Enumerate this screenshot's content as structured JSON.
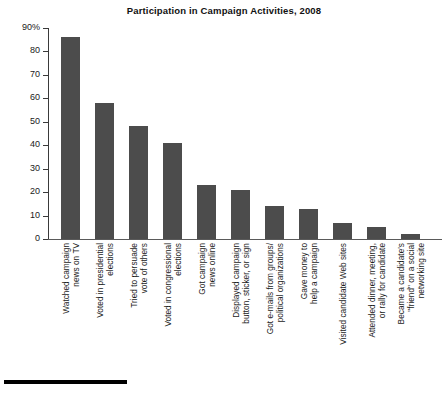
{
  "chart_data": {
    "type": "bar",
    "title": "Participation in Campaign Activities, 2008",
    "xlabel": "",
    "ylabel": "",
    "ylim": [
      0,
      90
    ],
    "grid": false,
    "legend": "none",
    "y_ticks": [
      "0",
      "10",
      "20",
      "30",
      "40",
      "50",
      "60",
      "70",
      "80",
      "90%"
    ],
    "y_tick_values": [
      0,
      10,
      20,
      30,
      40,
      50,
      60,
      70,
      80,
      90
    ],
    "categories": [
      "Watched campaign news on TV",
      "Voted in presidential elections",
      "Tried to persuade vote of others",
      "Voted in congressional elections",
      "Got campaign news online",
      "Displayed campaign button, sticker, or sign",
      "Got e-mails from groups/ political organizations",
      "Gave money to help a campaign",
      "Visited candidate Web sites",
      "Attended dinner, meeting, or rally for candidate",
      "Became a candidate's \"friend\" on a social networking site"
    ],
    "category_lines": [
      [
        "Watched campaign",
        "news on TV"
      ],
      [
        "Voted in presidential",
        "elections"
      ],
      [
        "Tried to persuade",
        "vote of others"
      ],
      [
        "Voted in congressional",
        "elections"
      ],
      [
        "Got campaign",
        "news online"
      ],
      [
        "Displayed campaign",
        "button, sticker, or sign"
      ],
      [
        "Got e-mails from groups/",
        "political organizations"
      ],
      [
        "Gave money to",
        "help a campaign"
      ],
      [
        "Visited candidate Web sites"
      ],
      [
        "Attended dinner, meeting,",
        "or rally for candidate"
      ],
      [
        "Became a candidate's",
        "\"friend\" on a social",
        "networking site"
      ]
    ],
    "values": [
      86,
      58,
      48,
      41,
      23,
      21,
      14,
      13,
      7,
      5,
      2
    ],
    "bar_color": "#4c4c4c",
    "axis_color": "#3a3a3a",
    "background": "#ffffff"
  }
}
